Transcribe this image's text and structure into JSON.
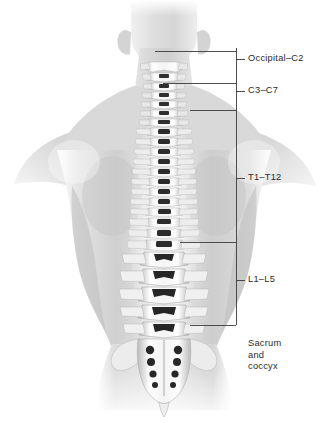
{
  "figure": {
    "width": 328,
    "height": 423,
    "background_color": "#ffffff",
    "style": "grayscale medical illustration"
  },
  "colors": {
    "background": "#ffffff",
    "text": "#2b2b2b",
    "leader_line": "#3c3c3c",
    "skin_light": "#f2f2f2",
    "skin_mid": "#c9c9c9",
    "skin_shadow": "#9a9a9a",
    "bone_light": "#fbfbfb",
    "bone_mid": "#d8d8d8",
    "bone_dark": "#5a5a5a",
    "foramen": "#2a2a2a"
  },
  "labels": [
    {
      "id": "occipital-c2",
      "text": "Occipital–C2",
      "region": "upper cervical",
      "x": 248,
      "y": 54,
      "tick_y": 59,
      "leader_x_start": 155,
      "multiline": false
    },
    {
      "id": "c3-c7",
      "text": "C3–C7",
      "region": "lower cervical",
      "x": 248,
      "y": 86,
      "tick_y": 91,
      "leader_x_start": 163,
      "multiline": false
    },
    {
      "id": "t1-t12",
      "text": "T1–T12",
      "region": "thoracic",
      "x": 248,
      "y": 173,
      "tick_y": 178,
      "leader_x_start": 236,
      "multiline": false
    },
    {
      "id": "l1-l5",
      "text": "L1–L5",
      "region": "lumbar",
      "x": 248,
      "y": 275,
      "tick_y": 280,
      "leader_x_start": 180,
      "multiline": false
    },
    {
      "id": "sacrum-coccyx",
      "text": "Sacrum and coccyx",
      "text_line1": "Sacrum",
      "text_line2": "and",
      "text_line3": "coccyx",
      "region": "sacrum and coccyx",
      "x": 248,
      "y": 340,
      "tick_y": 325,
      "leader_x_start": 190,
      "multiline": true
    }
  ],
  "rail": {
    "x": 236,
    "y_top": 48,
    "y_bottom": 325,
    "tick_length": 9
  },
  "spine_regions": [
    {
      "name": "cervical",
      "vertebra_count": 7,
      "y_start": 62,
      "y_end": 118
    },
    {
      "name": "thoracic",
      "vertebra_count": 12,
      "y_start": 118,
      "y_end": 242
    },
    {
      "name": "lumbar",
      "vertebra_count": 5,
      "y_start": 242,
      "y_end": 330
    },
    {
      "name": "sacrum",
      "vertebra_count": 5,
      "y_start": 330,
      "y_end": 390
    },
    {
      "name": "coccyx",
      "vertebra_count": 1,
      "y_start": 390,
      "y_end": 400
    }
  ]
}
